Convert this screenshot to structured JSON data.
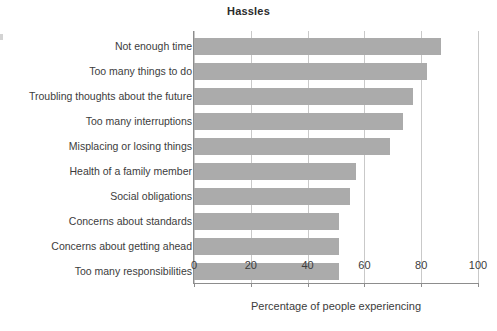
{
  "chart_data": {
    "type": "bar",
    "orientation": "horizontal",
    "title": "Hassles",
    "xlabel": "Percentage of people experiencing",
    "ylabel": "",
    "xlim": [
      0,
      100
    ],
    "xticks": [
      0,
      20,
      40,
      60,
      80,
      100
    ],
    "xtick_labels": [
      "0",
      "20",
      "40",
      "60",
      "80",
      "100"
    ],
    "grid": "vertical",
    "legend": "none",
    "bar_color": "#ababab",
    "axis_color": "#8d8d8d",
    "gridline_color": "#c9c9c9",
    "categories": [
      "Not enough time",
      "Too many things to do",
      "Troubling thoughts about the future",
      "Too many interruptions",
      "Misplacing or losing things",
      "Health of a family member",
      "Social obligations",
      "Concerns about standards",
      "Concerns about getting ahead",
      "Too many responsibilities"
    ],
    "values": [
      87,
      82,
      77,
      73.5,
      69,
      57,
      55,
      51,
      51,
      51
    ]
  }
}
